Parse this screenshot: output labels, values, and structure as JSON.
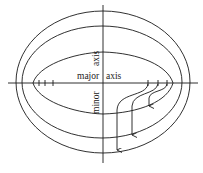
{
  "diagram": {
    "labels": {
      "major_left": "major",
      "major_right": "axis",
      "minor_top": "axis",
      "minor_bottom": "minor"
    },
    "ticks_left_count": 3,
    "ticks_right_count": 3,
    "arrows_count": 3,
    "curves": [
      "outer-ellipse",
      "middle-ellipse",
      "inner-egg-curve"
    ],
    "colors": {
      "stroke": "#1a1a1a",
      "background": "#ffffff"
    }
  }
}
